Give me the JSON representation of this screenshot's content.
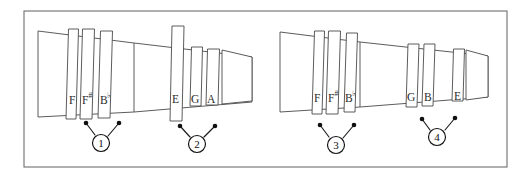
{
  "figure": {
    "title": "",
    "background_color": "#ffffff",
    "line_color": "#4a4a4a",
    "frame_color": "#6e6e6e",
    "ink_color": "#101010",
    "frame": {
      "x": 24,
      "y": 11,
      "width": 483,
      "height": 156
    }
  },
  "diagrams": [
    {
      "id": "left-instrument",
      "name": "left-tapered-pipe",
      "cone": {
        "x1": 38,
        "y_top1": 31,
        "y_bot1": 117,
        "x2": 134,
        "y_top2": 43,
        "y_bot2": 112
      },
      "tail": {
        "x1": 134,
        "y_top1": 43,
        "y_bot1": 112,
        "x2": 252,
        "y_top2": 57,
        "y_bot2": 102
      },
      "keys": [
        {
          "label": "F",
          "accidental": "",
          "x": 66,
          "width": 10,
          "y_top": 29,
          "y_bot": 119,
          "skew": 2.5,
          "label_x": 69,
          "label_y": 104
        },
        {
          "label": "F",
          "accidental": "#",
          "x": 80,
          "width": 12,
          "y_top": 29,
          "y_bot": 119,
          "skew": 2.5,
          "label_x": 82,
          "label_y": 104
        },
        {
          "label": "B",
          "accidental": "b",
          "x": 98,
          "width": 12,
          "y_top": 31,
          "y_bot": 118,
          "skew": 2.5,
          "label_x": 100,
          "label_y": 104
        },
        {
          "label": "E",
          "accidental": "",
          "x": 170,
          "width": 12,
          "y_top": 26,
          "y_bot": 121,
          "skew": 2.0,
          "label_x": 172,
          "label_y": 103
        },
        {
          "label": "G",
          "accidental": "",
          "x": 190,
          "width": 11,
          "y_top": 47,
          "y_bot": 106,
          "skew": 1.5,
          "label_x": 191,
          "label_y": 103
        },
        {
          "label": "A",
          "accidental": "",
          "x": 206,
          "width": 12,
          "y_top": 49,
          "y_bot": 105,
          "skew": 1.5,
          "label_x": 207,
          "label_y": 103
        }
      ],
      "end_cap": {
        "x1": 222,
        "y_top1": 50,
        "y_bot1": 104,
        "x2": 252,
        "y_top2": 57,
        "y_bot2": 101
      },
      "callouts": [
        {
          "number": "1",
          "circle": {
            "cx": 101,
            "cy": 143,
            "r": 8.5
          },
          "leaders": [
            {
              "dot_x": 86,
              "dot_y": 123,
              "to_x": 95,
              "to_y": 135
            },
            {
              "dot_x": 119,
              "dot_y": 123,
              "to_x": 108,
              "to_y": 136
            }
          ]
        },
        {
          "number": "2",
          "circle": {
            "cx": 197,
            "cy": 144,
            "r": 8.5
          },
          "leaders": [
            {
              "dot_x": 180,
              "dot_y": 126,
              "to_x": 190,
              "to_y": 137
            },
            {
              "dot_x": 215,
              "dot_y": 126,
              "to_x": 204,
              "to_y": 137
            }
          ]
        }
      ]
    },
    {
      "id": "right-instrument",
      "name": "right-tapered-pipe",
      "cone": {
        "x1": 280,
        "y_top1": 32,
        "y_bot1": 112,
        "x2": 360,
        "y_top2": 42,
        "y_bot2": 107
      },
      "tail": {
        "x1": 360,
        "y_top1": 42,
        "y_bot1": 107,
        "x2": 488,
        "y_top2": 56,
        "y_bot2": 97
      },
      "keys": [
        {
          "label": "F",
          "accidental": "",
          "x": 312,
          "width": 10,
          "y_top": 31,
          "y_bot": 114,
          "skew": 2.5,
          "label_x": 314,
          "label_y": 102
        },
        {
          "label": "F",
          "accidental": "#",
          "x": 326,
          "width": 12,
          "y_top": 31,
          "y_bot": 114,
          "skew": 2.5,
          "label_x": 328,
          "label_y": 102
        },
        {
          "label": "B",
          "accidental": "b",
          "x": 344,
          "width": 11,
          "y_top": 33,
          "y_bot": 112,
          "skew": 2.5,
          "label_x": 345,
          "label_y": 102
        },
        {
          "label": "G",
          "accidental": "",
          "x": 406,
          "width": 11,
          "y_top": 44,
          "y_bot": 107,
          "skew": 2.0,
          "label_x": 407,
          "label_y": 101
        },
        {
          "label": "B",
          "accidental": "",
          "x": 422,
          "width": 11,
          "y_top": 44,
          "y_bot": 106,
          "skew": 2.0,
          "label_x": 424,
          "label_y": 101
        },
        {
          "label": "E",
          "accidental": "",
          "x": 452,
          "width": 11,
          "y_top": 49,
          "y_bot": 101,
          "skew": 1.5,
          "label_x": 454,
          "label_y": 100
        }
      ],
      "end_cap": {
        "x1": 466,
        "y_top1": 50,
        "y_bot1": 100,
        "x2": 488,
        "y_top2": 56,
        "y_bot2": 97
      },
      "callouts": [
        {
          "number": "3",
          "circle": {
            "cx": 336,
            "cy": 145,
            "r": 8.5
          },
          "leaders": [
            {
              "dot_x": 320,
              "dot_y": 125,
              "to_x": 329,
              "to_y": 137
            },
            {
              "dot_x": 354,
              "dot_y": 125,
              "to_x": 343,
              "to_y": 138
            }
          ]
        },
        {
          "number": "4",
          "circle": {
            "cx": 437,
            "cy": 137,
            "r": 8.5
          },
          "leaders": [
            {
              "dot_x": 422,
              "dot_y": 119,
              "to_x": 430,
              "to_y": 130
            },
            {
              "dot_x": 455,
              "dot_y": 118,
              "to_x": 445,
              "to_y": 130
            }
          ]
        }
      ]
    }
  ],
  "labels": {
    "sharp_glyph": "#",
    "flat_glyph": "♭"
  }
}
